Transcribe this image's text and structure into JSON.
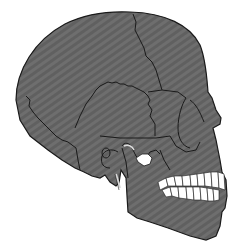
{
  "image": {
    "subject": "Human skull, lateral (side) view, facing right",
    "width": 238,
    "height": 249
  },
  "colors": {
    "background": "#ffffff",
    "bone_fill": "#6e6e6e",
    "bone_stripe": "#5e5e5e",
    "outline": "#1a1a1a",
    "teeth": "#ffffff"
  }
}
